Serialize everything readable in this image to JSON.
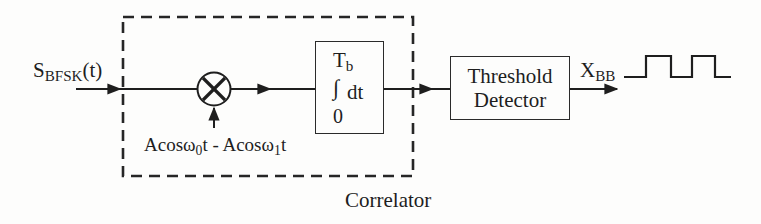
{
  "diagram": {
    "type": "block-diagram",
    "colors": {
      "ink": "#1e1e1e",
      "background": "#fdfdfc"
    },
    "input": {
      "signal_main": "S",
      "signal_sub": "BFSK",
      "signal_suffix": "(t)"
    },
    "multiplier": {
      "symbol": "×",
      "reference_signal": {
        "part1_main": "Acosω",
        "part1_sub": "0",
        "part1_suffix": "t - Acosω",
        "part2_sub": "1",
        "part2_suffix": "t"
      }
    },
    "integrator": {
      "upper_limit_main": "T",
      "upper_limit_sub": "b",
      "integral_sign": "∫",
      "integrand": "dt",
      "lower_limit": "0"
    },
    "correlator_group": {
      "label": "Correlator"
    },
    "threshold_detector": {
      "line1": "Threshold",
      "line2": "Detector"
    },
    "output": {
      "signal_main": "X",
      "signal_sub": "BB",
      "waveform": "square-wave"
    },
    "flow": [
      "S_BFSK(t)",
      "Multiplier",
      "Integrator (0 to Tb)",
      "Threshold Detector",
      "X_BB"
    ]
  }
}
